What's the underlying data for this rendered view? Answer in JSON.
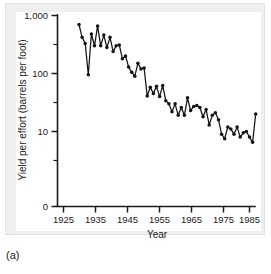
{
  "figure": {
    "caption": "(a)",
    "panel_background": "#efefef",
    "plot_background": "#ffffff",
    "ink_color": "#141414"
  },
  "chart_data": {
    "type": "line",
    "title": "",
    "subtitle": "",
    "xlabel": "Year",
    "ylabel": "Yield per effort (barrels per foot)",
    "yscale": "log",
    "xscale": "linear",
    "grid": false,
    "legend": null,
    "xlim": [
      1923,
      1989
    ],
    "ylim": [
      3,
      1000
    ],
    "xticks": [
      1925,
      1935,
      1945,
      1955,
      1965,
      1975,
      1985
    ],
    "xticklabels": [
      "1925",
      "1935",
      "1945",
      "1955",
      "1965",
      "1975",
      "1985"
    ],
    "yticks": [
      1000,
      100,
      10,
      0
    ],
    "yticklabels": [
      "1,000",
      "100",
      "10",
      "0"
    ],
    "y_minor_ticks": [
      500,
      50,
      5
    ],
    "marker": "filled-circle",
    "series": [
      {
        "name": "Yield per effort",
        "x": [
          1930,
          1931,
          1932,
          1933,
          1934,
          1935,
          1936,
          1937,
          1938,
          1939,
          1940,
          1941,
          1942,
          1943,
          1944,
          1945,
          1946,
          1947,
          1948,
          1949,
          1950,
          1951,
          1952,
          1953,
          1954,
          1955,
          1956,
          1957,
          1958,
          1959,
          1960,
          1961,
          1962,
          1963,
          1964,
          1965,
          1966,
          1967,
          1968,
          1969,
          1970,
          1971,
          1972,
          1973,
          1974,
          1975,
          1976,
          1977,
          1978,
          1979,
          1980,
          1981,
          1982,
          1983,
          1984,
          1985,
          1986,
          1987
        ],
        "values": [
          700,
          420,
          330,
          95,
          480,
          300,
          660,
          300,
          460,
          280,
          420,
          240,
          300,
          310,
          180,
          200,
          130,
          105,
          90,
          150,
          120,
          125,
          41,
          58,
          45,
          60,
          40,
          62,
          34,
          30,
          22,
          30,
          19,
          26,
          19,
          38,
          23,
          27,
          28,
          26,
          18,
          24,
          13,
          19,
          21,
          16,
          9,
          7.5,
          12,
          11,
          9,
          12,
          8,
          9.5,
          10,
          8,
          6.5,
          20
        ]
      }
    ]
  },
  "axes": {
    "x_axis_name": "year-axis",
    "y_axis_name": "yield-axis"
  }
}
